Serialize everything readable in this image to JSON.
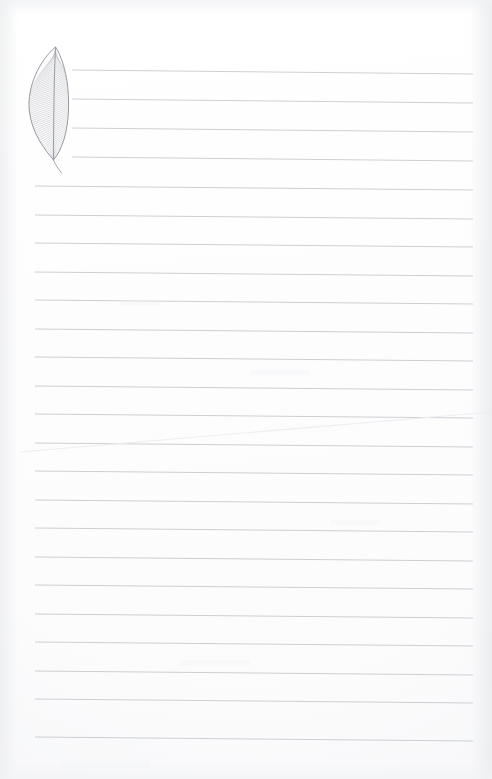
{
  "document": {
    "kind": "scanned-lined-notepaper",
    "title": "Feather Notepaper Sheet",
    "page_width": 492,
    "page_height": 779,
    "background_color": "#fdfdfe",
    "paper_edge_color": "#eef0f2",
    "text_content": "",
    "has_handwriting": false
  },
  "illustration": {
    "name": "feather",
    "label": "Feather drawing",
    "style": "fine pen line drawing",
    "outline_color": "#8a8d93",
    "barb_color": "#b9bcc2",
    "rachis_color": "#9ea1a7",
    "fill_color": "#fcfcfd",
    "bounds": {
      "x": 28,
      "y": 44,
      "width": 42,
      "height": 130
    },
    "vane_top_y": 48,
    "vane_bottom_y": 160,
    "quill_tip_y": 173,
    "barb_count": 58
  },
  "ruling": {
    "line_color": "#c9cbcf",
    "line_color_faint": "#dcdee1",
    "line_width": 1,
    "spacing": 28.6,
    "slant_px": 4,
    "short_lines": {
      "count": 4,
      "x_start": 72,
      "x_end": 473,
      "y_positions": [
        70,
        99,
        128,
        157
      ]
    },
    "full_lines": {
      "count": 20,
      "x_start": 35,
      "x_end": 473,
      "y_positions": [
        186,
        215,
        243,
        272,
        300,
        329,
        357,
        386,
        414,
        443,
        471,
        500,
        528,
        557,
        585,
        614,
        642,
        671,
        699,
        737
      ]
    }
  },
  "artifacts": {
    "crease": {
      "name": "diagonal-scan-crease",
      "color": "#eceef0",
      "x1": 20,
      "y1": 452,
      "x2": 492,
      "y2": 412
    },
    "smudges": [
      {
        "x": 120,
        "y": 300,
        "w": 40,
        "h": 6,
        "opacity": 0.35
      },
      {
        "x": 250,
        "y": 370,
        "w": 60,
        "h": 5,
        "opacity": 0.3
      },
      {
        "x": 330,
        "y": 520,
        "w": 50,
        "h": 5,
        "opacity": 0.28
      },
      {
        "x": 180,
        "y": 660,
        "w": 70,
        "h": 6,
        "opacity": 0.3
      },
      {
        "x": 60,
        "y": 760,
        "w": 90,
        "h": 8,
        "opacity": 0.25
      }
    ]
  }
}
